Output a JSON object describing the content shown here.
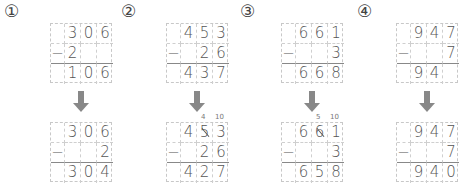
{
  "problems": [
    {
      "label": "①",
      "before": {
        "top": [
          "",
          "3",
          "0",
          "6"
        ],
        "mid": [
          "−",
          "2",
          "",
          ""
        ],
        "bottom": [
          "",
          "1",
          "0",
          "6"
        ]
      },
      "after": {
        "top": [
          "",
          "3",
          "0",
          "6"
        ],
        "mid": [
          "−",
          "",
          "",
          "2"
        ],
        "bottom": [
          "",
          "3",
          "0",
          "4"
        ]
      },
      "borrow": null
    },
    {
      "label": "②",
      "before": {
        "top": [
          "",
          "4",
          "5",
          "3"
        ],
        "mid": [
          "−",
          "",
          "2",
          "6"
        ],
        "bottom": [
          "",
          "4",
          "3",
          "7"
        ]
      },
      "after": {
        "top": [
          "",
          "4",
          "5",
          "3"
        ],
        "mid": [
          "−",
          "",
          "2",
          "6"
        ],
        "bottom": [
          "",
          "4",
          "2",
          "7"
        ]
      },
      "borrow": {
        "tens_note": "4",
        "ones_note": "10"
      }
    },
    {
      "label": "③",
      "before": {
        "top": [
          "",
          "6",
          "6",
          "1"
        ],
        "mid": [
          "−",
          "",
          "",
          "3"
        ],
        "bottom": [
          "",
          "6",
          "6",
          "8"
        ]
      },
      "after": {
        "top": [
          "",
          "6",
          "6",
          "1"
        ],
        "mid": [
          "−",
          "",
          "",
          "3"
        ],
        "bottom": [
          "",
          "6",
          "5",
          "8"
        ]
      },
      "borrow": {
        "tens_note": "5",
        "ones_note": "10"
      }
    },
    {
      "label": "④",
      "before": {
        "top": [
          "",
          "9",
          "4",
          "7"
        ],
        "mid": [
          "−",
          "",
          "",
          "7"
        ],
        "bottom": [
          "",
          "9",
          "4",
          ""
        ]
      },
      "after": {
        "top": [
          "",
          "9",
          "4",
          "7"
        ],
        "mid": [
          "−",
          "",
          "",
          "7"
        ],
        "bottom": [
          "",
          "9",
          "4",
          "0"
        ]
      },
      "borrow": null
    }
  ],
  "icons": {
    "arrow": "arrow-down-icon",
    "strike": "strike-slash"
  },
  "colors": {
    "arrow": "#888888",
    "grid": "#c8c8c8",
    "text": "#555555"
  }
}
